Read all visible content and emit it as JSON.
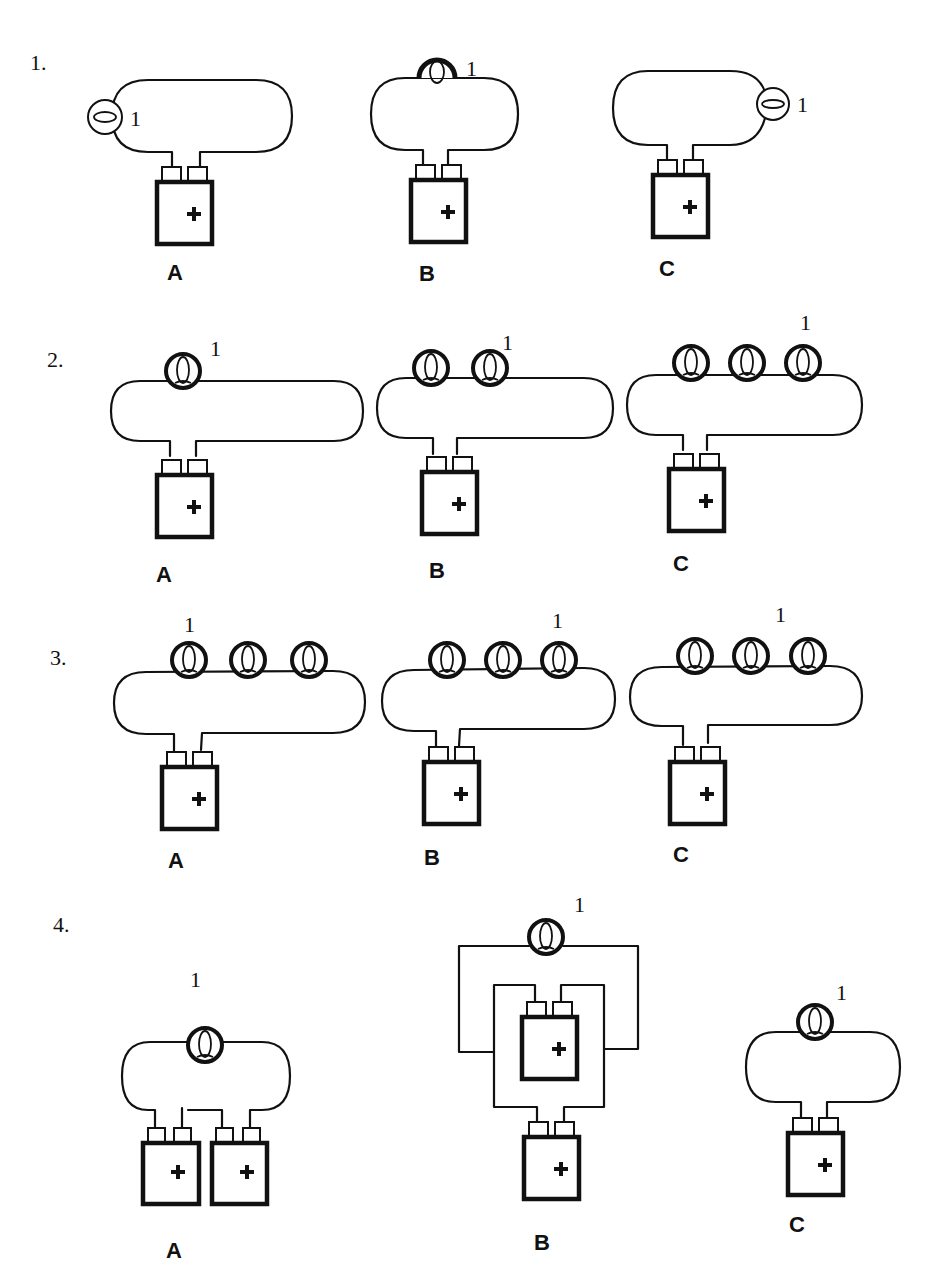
{
  "questions": [
    {
      "number": "1.",
      "options": [
        {
          "label": "A",
          "bulb_label": "1",
          "bulb_count": 1,
          "bulb_position": "left side of loop"
        },
        {
          "label": "B",
          "bulb_label": "1",
          "bulb_count": 1,
          "bulb_position": "top of loop"
        },
        {
          "label": "C",
          "bulb_label": "1",
          "bulb_count": 1,
          "bulb_position": "right side of loop"
        }
      ]
    },
    {
      "number": "2.",
      "options": [
        {
          "label": "A",
          "bulb_label": "1",
          "bulb_count": 1
        },
        {
          "label": "B",
          "bulb_label": "1",
          "bulb_count": 2
        },
        {
          "label": "C",
          "bulb_label": "1",
          "bulb_count": 3
        }
      ]
    },
    {
      "number": "3.",
      "options": [
        {
          "label": "A",
          "bulb_label": "1",
          "bulb_count": 3,
          "labeled_bulb": "first"
        },
        {
          "label": "B",
          "bulb_label": "1",
          "bulb_count": 3,
          "labeled_bulb": "third"
        },
        {
          "label": "C",
          "bulb_label": "1",
          "bulb_count": 3,
          "labeled_bulb": "third"
        }
      ]
    },
    {
      "number": "4.",
      "options": [
        {
          "label": "A",
          "bulb_label": "1",
          "bulb_count": 1,
          "battery_count": 2
        },
        {
          "label": "B",
          "bulb_label": "1",
          "bulb_count": 1,
          "battery_count": 2
        },
        {
          "label": "C",
          "bulb_label": "1",
          "bulb_count": 1,
          "battery_count": 1
        }
      ]
    }
  ],
  "battery_symbol": "+",
  "colors": {
    "ink": "#111111",
    "background": "#ffffff"
  }
}
